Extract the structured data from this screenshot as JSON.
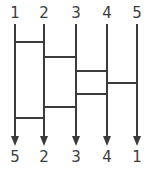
{
  "diagram": {
    "type": "wiring-diagram",
    "width": 149,
    "height": 172,
    "background_color": "#ffffff",
    "line_color": "#3b3b3b",
    "label_color": "#3b3b3b",
    "line_width": 2,
    "wire_count": 5,
    "wire_x": [
      15,
      44,
      76,
      107,
      137
    ],
    "wire_top_y": 24,
    "wire_bottom_y": 136,
    "arrow_tip_y": 146,
    "arrow_half_width": 4,
    "top_labels": [
      "1",
      "2",
      "3",
      "4",
      "5"
    ],
    "bottom_labels": [
      "5",
      "2",
      "3",
      "4",
      "1"
    ],
    "top_label_y": 6,
    "bottom_label_y": 150,
    "crossbars": [
      {
        "name": "crossbar-1",
        "from_wire": 1,
        "to_wire": 2,
        "from_x": 15,
        "to_x": 44,
        "y": 42
      },
      {
        "name": "crossbar-2",
        "from_wire": 2,
        "to_wire": 3,
        "from_x": 44,
        "to_x": 76,
        "y": 57
      },
      {
        "name": "crossbar-3",
        "from_wire": 3,
        "to_wire": 4,
        "from_x": 76,
        "to_x": 107,
        "y": 71
      },
      {
        "name": "crossbar-4",
        "from_wire": 4,
        "to_wire": 5,
        "from_x": 107,
        "to_x": 137,
        "y": 83
      },
      {
        "name": "crossbar-5",
        "from_wire": 3,
        "to_wire": 4,
        "from_x": 76,
        "to_x": 107,
        "y": 94
      },
      {
        "name": "crossbar-6",
        "from_wire": 2,
        "to_wire": 3,
        "from_x": 44,
        "to_x": 76,
        "y": 107
      },
      {
        "name": "crossbar-7",
        "from_wire": 1,
        "to_wire": 2,
        "from_x": 15,
        "to_x": 44,
        "y": 118
      }
    ]
  }
}
